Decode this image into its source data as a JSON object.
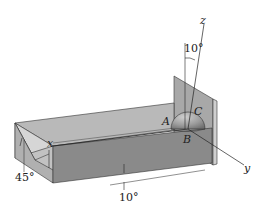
{
  "figure": {
    "type": "engineering mechanics diagram",
    "labels": {
      "axis_x": "x",
      "axis_y": "y",
      "axis_z": "z",
      "point_a": "A",
      "point_b": "B",
      "point_c": "C",
      "angle_z_tilt": "10°",
      "angle_groove": "45°",
      "angle_incline": "10°"
    },
    "colors": {
      "front_face": "#8a8a8a",
      "top_face": "#b9b9b9",
      "back_plate": "#a8a8a8",
      "plate_edge": "#cfcfcf",
      "groove_face": "#d6d6d6",
      "hemisphere": "#9c9c9c",
      "line": "#222222",
      "background": "#ffffff"
    }
  }
}
